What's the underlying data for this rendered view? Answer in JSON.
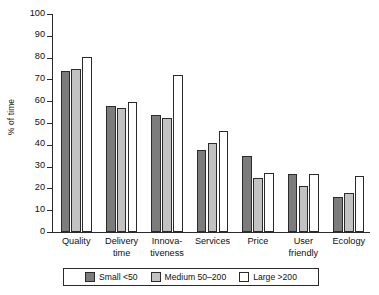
{
  "chart_data": {
    "type": "bar",
    "title": "",
    "xlabel": "",
    "ylabel": "% of time",
    "ylim": [
      0,
      100
    ],
    "ytick_step": 10,
    "yticks": [
      0,
      10,
      20,
      30,
      40,
      50,
      60,
      70,
      80,
      90,
      100
    ],
    "grid": false,
    "legend_position": "bottom",
    "categories": [
      "Quality",
      "Delivery time",
      "Innova-tiveness",
      "Services",
      "Price",
      "User friendly",
      "Ecology"
    ],
    "category_lines": [
      [
        "Quality"
      ],
      [
        "Delivery",
        "time"
      ],
      [
        "Innova-",
        "tiveness"
      ],
      [
        "Services"
      ],
      [
        "Price"
      ],
      [
        "User",
        "friendly"
      ],
      [
        "Ecology"
      ]
    ],
    "series": [
      {
        "name": "Small <50",
        "color": "#7c7c7c",
        "values": [
          74,
          58,
          53.5,
          37.5,
          35,
          26.5,
          16
        ]
      },
      {
        "name": "Medium 50–200",
        "color": "#c2c2c2",
        "values": [
          75,
          57,
          52.5,
          41,
          25,
          21,
          18
        ]
      },
      {
        "name": "Large >200",
        "color": "#ffffff",
        "values": [
          80.5,
          59.5,
          72,
          46.5,
          27,
          26.5,
          25.5
        ]
      }
    ]
  },
  "legend": {
    "entries": [
      {
        "label": "Small <50",
        "swatch": "small"
      },
      {
        "label": "Medium 50–200",
        "swatch": "medium"
      },
      {
        "label": "Large >200",
        "swatch": "large"
      }
    ]
  },
  "axis": {
    "y_title": "% of time"
  }
}
